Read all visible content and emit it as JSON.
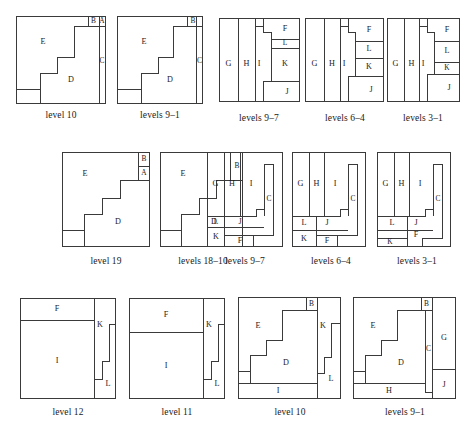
{
  "figure": {
    "caption": "",
    "rows": [
      {
        "id": "row-1",
        "panels": [
          {
            "id": "r1p1",
            "caption": "level 10",
            "labels": [
              "E",
              "B",
              "A",
              "C",
              "D"
            ]
          },
          {
            "id": "r1p2",
            "caption": "levels 9–1",
            "labels": [
              "E",
              "B",
              "C",
              "D"
            ]
          },
          {
            "id": "r1p3",
            "caption": "levels 9–7",
            "labels": [
              "G",
              "H",
              "I",
              "F",
              "L",
              "K",
              "J"
            ]
          },
          {
            "id": "r1p4",
            "caption": "levels 6–4",
            "labels": [
              "G",
              "H",
              "I",
              "F",
              "L",
              "K",
              "J"
            ]
          },
          {
            "id": "r1p5",
            "caption": "levels 3–1",
            "labels": [
              "G",
              "H",
              "I",
              "F",
              "L",
              "K",
              "J"
            ]
          }
        ]
      },
      {
        "id": "row-2",
        "panels": [
          {
            "id": "r2p1",
            "caption": "level 19",
            "labels": [
              "E",
              "B",
              "A",
              "D"
            ]
          },
          {
            "id": "r2p2",
            "caption": "levels 18–10",
            "labels": [
              "E",
              "B",
              "D"
            ]
          },
          {
            "id": "r2p3",
            "caption": "levels 9–7",
            "labels": [
              "G",
              "H",
              "I",
              "C",
              "L",
              "J",
              "K",
              "F"
            ]
          },
          {
            "id": "r2p4",
            "caption": "levels 6–4",
            "labels": [
              "G",
              "H",
              "I",
              "C",
              "L",
              "J",
              "K",
              "F"
            ]
          },
          {
            "id": "r2p5",
            "caption": "levels 3–1",
            "labels": [
              "G",
              "H",
              "I",
              "C",
              "L",
              "J",
              "K",
              "F"
            ]
          }
        ]
      },
      {
        "id": "row-3",
        "panels": [
          {
            "id": "r3p1",
            "caption": "level 12",
            "labels": [
              "F",
              "I",
              "K",
              "L"
            ]
          },
          {
            "id": "r3p2",
            "caption": "level 11",
            "labels": [
              "F",
              "I",
              "K",
              "L"
            ]
          },
          {
            "id": "r3p3",
            "caption": "level 10",
            "labels": [
              "E",
              "B",
              "D",
              "I",
              "K",
              "L"
            ]
          },
          {
            "id": "r3p4",
            "caption": "levels 9–1",
            "labels": [
              "E",
              "B",
              "D",
              "H",
              "C",
              "G",
              "J"
            ]
          }
        ]
      }
    ]
  },
  "colors": {
    "stroke": "#3a3a3a",
    "text": "#1a1a1a",
    "background": "#ffffff"
  }
}
